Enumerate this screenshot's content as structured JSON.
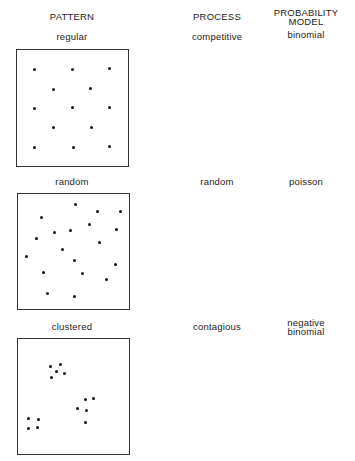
{
  "headers": {
    "pattern": "PATTERN",
    "process": "PROCESS",
    "model_line1": "PROBABILITY",
    "model_line2": "MODEL"
  },
  "rows": [
    {
      "pattern": "regular",
      "process": "competitive",
      "model_line1": "binomial",
      "model_line2": "",
      "box": {
        "left": 16,
        "top": 49,
        "width": 113,
        "height": 118
      },
      "dots": [
        [
          34,
          69
        ],
        [
          72,
          69
        ],
        [
          109,
          68
        ],
        [
          53,
          89
        ],
        [
          90,
          88
        ],
        [
          34,
          108
        ],
        [
          72,
          107
        ],
        [
          109,
          107
        ],
        [
          53,
          127
        ],
        [
          91,
          127
        ],
        [
          34,
          147
        ],
        [
          73,
          147
        ],
        [
          109,
          146
        ]
      ]
    },
    {
      "pattern": "random",
      "process": "random",
      "model_line1": "poisson",
      "model_line2": "",
      "box": {
        "left": 17,
        "top": 193,
        "width": 113,
        "height": 117
      },
      "dots": [
        [
          75,
          204
        ],
        [
          97,
          211
        ],
        [
          120,
          211
        ],
        [
          41,
          217
        ],
        [
          89,
          224
        ],
        [
          70,
          230
        ],
        [
          54,
          232
        ],
        [
          116,
          229
        ],
        [
          36,
          238
        ],
        [
          99,
          242
        ],
        [
          62,
          249
        ],
        [
          26,
          256
        ],
        [
          74,
          260
        ],
        [
          115,
          264
        ],
        [
          43,
          272
        ],
        [
          82,
          273
        ],
        [
          106,
          279
        ],
        [
          47,
          293
        ],
        [
          74,
          296
        ]
      ]
    },
    {
      "pattern": "clustered",
      "process": "contagious",
      "model_line1": "negative",
      "model_line2": "binomial",
      "box": {
        "left": 17,
        "top": 338,
        "width": 113,
        "height": 117
      },
      "dots": [
        [
          50,
          366
        ],
        [
          60,
          364
        ],
        [
          56,
          371
        ],
        [
          64,
          373
        ],
        [
          51,
          377
        ],
        [
          85,
          399
        ],
        [
          93,
          398
        ],
        [
          77,
          408
        ],
        [
          86,
          410
        ],
        [
          85,
          422
        ],
        [
          28,
          418
        ],
        [
          38,
          419
        ],
        [
          28,
          428
        ],
        [
          37,
          427
        ]
      ]
    }
  ]
}
